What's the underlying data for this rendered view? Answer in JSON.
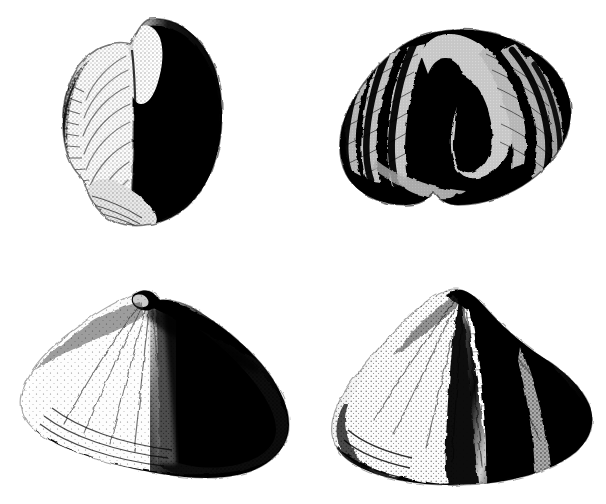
{
  "plate": {
    "title": "Fossil brachiopod specimens",
    "background_color": "#ffffff",
    "ink_color": "#0d0d0d",
    "mid_tone_color": "#4a4a4a",
    "highlight_color": "#ffffff",
    "width": 606,
    "height": 504,
    "technique": "stipple halftone engraving",
    "specimen_count": 4
  },
  "specimens": [
    {
      "id": "specimen-1",
      "label": "",
      "view": "lateral view",
      "position": "top-left",
      "bbox": {
        "x": 62,
        "y": 18,
        "w": 162,
        "h": 208
      },
      "description": "Two valves seen from the side; pale left valve with radiating growth ridges, strongly shaded dark right valve, white beak notch at top",
      "features": [
        "beak",
        "pale-valve",
        "dark-valve",
        "growth-lines",
        "commissure"
      ]
    },
    {
      "id": "specimen-2",
      "label": "",
      "view": "anterior view",
      "position": "top-right",
      "bbox": {
        "x": 338,
        "y": 28,
        "w": 234,
        "h": 178
      },
      "description": "Anterior commissure view showing deep median sulcus and strong plications forming a zigzag margin",
      "features": [
        "fold",
        "sulcus",
        "plications",
        "zigzag-commissure"
      ],
      "plication_count": 8
    },
    {
      "id": "specimen-3",
      "label": "",
      "view": "dorsal valve",
      "position": "bottom-left",
      "bbox": {
        "x": 20,
        "y": 288,
        "w": 272,
        "h": 190
      },
      "description": "Fan-shaped dorsal valve with small hooked beak at the top, broad alate wings, fine radial costae and strong lateral shading",
      "features": [
        "beak",
        "hinge-line",
        "alate-wing",
        "radial-costae",
        "anterior-margin"
      ]
    },
    {
      "id": "specimen-4",
      "label": "",
      "view": "ventral valve",
      "position": "bottom-right",
      "bbox": {
        "x": 330,
        "y": 288,
        "w": 262,
        "h": 196
      },
      "description": "Fan-shaped ventral valve with a raised median fold, deep flanking sulcus, fine radial costae and concentric growth lamellae near the margin",
      "features": [
        "umbo",
        "median-fold",
        "sulcus",
        "radial-costae",
        "growth-lamellae"
      ]
    }
  ]
}
